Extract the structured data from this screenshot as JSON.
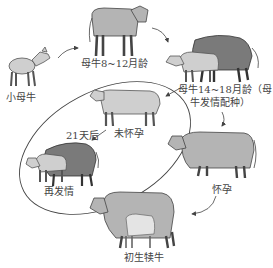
{
  "diagram": {
    "type": "life-cycle",
    "stages": [
      {
        "id": "calf",
        "label": "小母牛"
      },
      {
        "id": "heifer",
        "label": "母牛8~12月龄"
      },
      {
        "id": "breeding",
        "label_line1": "母牛14~18月龄（母",
        "label_line2": "牛发情配种）"
      },
      {
        "id": "pregnant",
        "label": "怀孕"
      },
      {
        "id": "newborn",
        "label": "初生犊牛"
      }
    ],
    "loop": {
      "not_pregnant": "未怀孕",
      "after_days": "21天后",
      "reheat": "再发情"
    },
    "colors": {
      "light_cow": "#cfcfcf",
      "mid_cow": "#b4b4b4",
      "bull": "#7a7a7a",
      "line": "#444444"
    }
  }
}
